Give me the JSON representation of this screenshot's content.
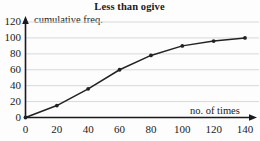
{
  "chart_data": {
    "type": "line",
    "title": "Less than ogive",
    "xlabel": "no. of times",
    "ylabel": "cumulative freq.",
    "x": [
      0,
      20,
      40,
      60,
      80,
      100,
      120,
      140
    ],
    "values": [
      0,
      15,
      36,
      60,
      78,
      90,
      96,
      100
    ],
    "series": [
      {
        "name": "cumulative freq.",
        "values": [
          0,
          15,
          36,
          60,
          78,
          90,
          96,
          100
        ]
      }
    ],
    "xlim": [
      0,
      140
    ],
    "ylim": [
      0,
      120
    ],
    "xticks": [
      "0",
      "20",
      "40",
      "60",
      "80",
      "100",
      "120",
      "140"
    ],
    "yticks": [
      "0",
      "20",
      "40",
      "60",
      "80",
      "100",
      "120"
    ],
    "grid": "horizontal",
    "legend": "none",
    "marker": "filled-circle",
    "line_color": "#222222",
    "grid_color": "#d8d8d8",
    "axis_color": "#1a1a1a"
  }
}
